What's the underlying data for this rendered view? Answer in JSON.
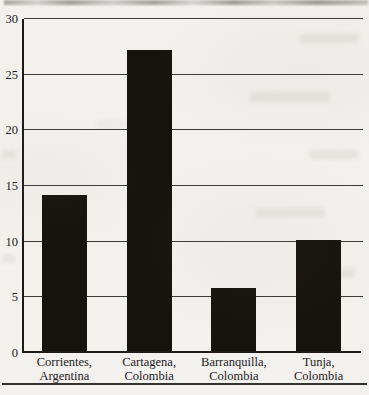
{
  "page": {
    "background_color": "#f3f1ee",
    "bottom_rule_color": "#34312e"
  },
  "chart_data": {
    "type": "bar",
    "categories": [
      "Corrientes,\nArgentina",
      "Cartagena,\nColombia",
      "Barranquilla,\nColombia",
      "Tunja,\nColombia"
    ],
    "values": [
      14,
      27,
      5.7,
      10
    ],
    "title": "",
    "xlabel": "",
    "ylabel": "",
    "ylim": [
      0,
      30
    ],
    "yticks": [
      0,
      5,
      10,
      15,
      20,
      25,
      30
    ],
    "grid": true,
    "legend": false,
    "bar_color": "#16120e",
    "gridline_color": "#3d3b38",
    "axis_color": "#1d1a17",
    "tick_label_color": "#22201d"
  }
}
